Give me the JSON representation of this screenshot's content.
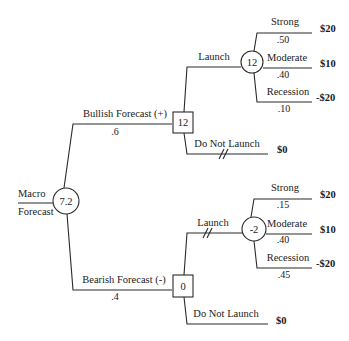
{
  "root": {
    "label_top": "Macro",
    "label_bottom": "Forecast",
    "value": "7.2",
    "type": "chance"
  },
  "branches": [
    {
      "label": "Bullish Forecast (+)",
      "probability": ".6",
      "decision": {
        "value": "12",
        "type": "decision",
        "launch": {
          "label": "Launch",
          "pruned": false,
          "chance": {
            "value": "12",
            "outcomes": [
              {
                "label": "Strong",
                "probability": ".50",
                "payoff": "$20"
              },
              {
                "label": "Moderate",
                "probability": ".40",
                "payoff": "$10"
              },
              {
                "label": "Recession",
                "probability": ".10",
                "payoff": "-$20"
              }
            ]
          }
        },
        "no_launch": {
          "label": "Do Not Launch",
          "pruned": true,
          "payoff": "$0"
        }
      }
    },
    {
      "label": "Bearish Forecast (-)",
      "probability": ".4",
      "decision": {
        "value": "0",
        "type": "decision",
        "launch": {
          "label": "Launch",
          "pruned": true,
          "chance": {
            "value": "-2",
            "outcomes": [
              {
                "label": "Strong",
                "probability": ".15",
                "payoff": "$20"
              },
              {
                "label": "Moderate",
                "probability": ".40",
                "payoff": "$10"
              },
              {
                "label": "Recession",
                "probability": ".45",
                "payoff": "-$20"
              }
            ]
          }
        },
        "no_launch": {
          "label": "Do Not Launch",
          "pruned": false,
          "payoff": "$0"
        }
      }
    }
  ]
}
